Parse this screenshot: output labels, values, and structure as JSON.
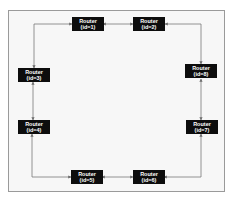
{
  "diagram": {
    "type": "ring-topology",
    "line_color": "#7a7a7a",
    "node_color": "#0d0d0d",
    "node_text_color": "#ffffff",
    "nodes": [
      {
        "id": 1,
        "title": "Router",
        "label": "(id=1)",
        "x": 72,
        "y": 17
      },
      {
        "id": 2,
        "title": "Router",
        "label": "(id=2)",
        "x": 133,
        "y": 17
      },
      {
        "id": 3,
        "title": "Router",
        "label": "(id=3)",
        "x": 18,
        "y": 68
      },
      {
        "id": 8,
        "title": "Router",
        "label": "(id=8)",
        "x": 185,
        "y": 64
      },
      {
        "id": 4,
        "title": "Router",
        "label": "(id=4)",
        "x": 18,
        "y": 120
      },
      {
        "id": 7,
        "title": "Router",
        "label": "(id=7)",
        "x": 186,
        "y": 120
      },
      {
        "id": 5,
        "title": "Router",
        "label": "(id=5)",
        "x": 71,
        "y": 170
      },
      {
        "id": 6,
        "title": "Router",
        "label": "(id=6)",
        "x": 133,
        "y": 170
      }
    ],
    "edges": [
      {
        "from": 1,
        "to": 2,
        "bidirectional": true
      },
      {
        "from": 2,
        "to": 8,
        "bidirectional": true
      },
      {
        "from": 8,
        "to": 7,
        "bidirectional": true
      },
      {
        "from": 7,
        "to": 6,
        "bidirectional": true
      },
      {
        "from": 6,
        "to": 5,
        "bidirectional": true
      },
      {
        "from": 5,
        "to": 4,
        "bidirectional": true
      },
      {
        "from": 4,
        "to": 3,
        "bidirectional": true
      },
      {
        "from": 3,
        "to": 1,
        "bidirectional": true
      }
    ]
  }
}
